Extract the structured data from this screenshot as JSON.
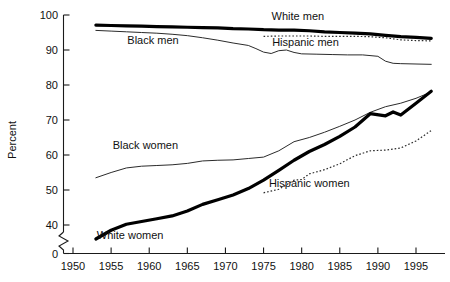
{
  "chart_data": {
    "type": "line",
    "title": "",
    "xlabel": "",
    "ylabel": "Percent",
    "xlim": [
      1950,
      1998
    ],
    "ylim": [
      0,
      100
    ],
    "y_axis_break": {
      "from": 0,
      "to": 38,
      "style": "zigzag"
    },
    "xticks": [
      1950,
      1955,
      1960,
      1965,
      1970,
      1975,
      1980,
      1985,
      1990,
      1995
    ],
    "yticks": [
      0,
      40,
      50,
      60,
      70,
      80,
      90,
      100
    ],
    "grid": false,
    "legend_position": "inline-annotations",
    "series": [
      {
        "name": "White men",
        "style": "thick-solid",
        "label": "White men",
        "label_x": 1979.5,
        "label_y": 99.7,
        "x": [
          1953,
          1955,
          1957,
          1959,
          1961,
          1963,
          1965,
          1967,
          1969,
          1971,
          1973,
          1975,
          1977,
          1979,
          1981,
          1983,
          1985,
          1987,
          1989,
          1991,
          1993,
          1995,
          1997
        ],
        "y": [
          97.1,
          97.0,
          96.9,
          96.8,
          96.7,
          96.6,
          96.5,
          96.4,
          96.3,
          96.1,
          96.0,
          95.8,
          95.7,
          95.7,
          95.5,
          95.2,
          95.0,
          94.8,
          94.6,
          94.2,
          93.8,
          93.6,
          93.3
        ]
      },
      {
        "name": "Black men",
        "style": "thin-solid",
        "label": "Black men",
        "label_x": 1960.5,
        "label_y": 93.0,
        "x": [
          1953,
          1955,
          1957,
          1959,
          1961,
          1963,
          1965,
          1967,
          1969,
          1971,
          1973,
          1974,
          1975,
          1976,
          1977,
          1978,
          1979,
          1980,
          1982,
          1984,
          1986,
          1988,
          1990,
          1991,
          1992,
          1993,
          1995,
          1997
        ],
        "y": [
          95.6,
          95.4,
          95.2,
          95.0,
          94.8,
          94.5,
          94.1,
          93.5,
          92.8,
          92.0,
          91.3,
          90.4,
          89.4,
          89.0,
          89.8,
          90.0,
          89.3,
          88.9,
          88.8,
          88.7,
          88.6,
          88.6,
          88.2,
          86.8,
          86.2,
          86.1,
          86.0,
          85.9
        ]
      },
      {
        "name": "Hispanic men",
        "style": "dotted",
        "label": "Hispanic men",
        "label_x": 1980.5,
        "label_y": 92.2,
        "x": [
          1975,
          1977,
          1979,
          1981,
          1983,
          1985,
          1987,
          1989,
          1991,
          1993,
          1995,
          1997
        ],
        "y": [
          93.9,
          94.0,
          94.0,
          94.0,
          93.9,
          93.9,
          93.9,
          93.8,
          93.5,
          92.9,
          92.7,
          92.6
        ]
      },
      {
        "name": "Black women",
        "style": "thin-solid",
        "label": "Black women",
        "label_x": 1959.5,
        "label_y": 62.8,
        "x": [
          1953,
          1955,
          1957,
          1959,
          1961,
          1963,
          1965,
          1967,
          1969,
          1971,
          1973,
          1975,
          1977,
          1979,
          1981,
          1983,
          1985,
          1987,
          1989,
          1991,
          1993,
          1995,
          1997
        ],
        "y": [
          53.5,
          55.0,
          56.3,
          56.8,
          57.0,
          57.2,
          57.6,
          58.3,
          58.5,
          58.6,
          59.0,
          59.4,
          61.2,
          63.8,
          65.0,
          66.5,
          68.2,
          70.0,
          72.2,
          73.8,
          74.8,
          76.2,
          78.0
        ]
      },
      {
        "name": "White women",
        "style": "thick-solid",
        "label": "White women",
        "label_x": 1957.5,
        "label_y": 37.2,
        "x": [
          1953,
          1955,
          1957,
          1959,
          1961,
          1963,
          1965,
          1967,
          1969,
          1971,
          1973,
          1975,
          1977,
          1979,
          1981,
          1983,
          1985,
          1987,
          1989,
          1991,
          1992,
          1993,
          1995,
          1997
        ],
        "y": [
          36.0,
          38.5,
          40.2,
          41.0,
          41.8,
          42.6,
          44.0,
          45.9,
          47.2,
          48.6,
          50.4,
          52.8,
          55.6,
          58.5,
          61.0,
          63.0,
          65.3,
          68.0,
          71.8,
          71.2,
          72.3,
          71.4,
          74.8,
          78.2
        ]
      },
      {
        "name": "Hispanic women",
        "style": "dotted",
        "label": "Hispanic women",
        "label_x": 1981.0,
        "label_y": 52.0,
        "x": [
          1975,
          1977,
          1979,
          1980,
          1981,
          1983,
          1985,
          1987,
          1989,
          1991,
          1993,
          1995,
          1997
        ],
        "y": [
          49.2,
          50.2,
          52.8,
          53.0,
          54.6,
          55.8,
          57.5,
          59.8,
          61.2,
          61.4,
          62.0,
          64.0,
          67.0
        ]
      }
    ]
  },
  "axes": {
    "ylabel": "Percent",
    "ytick_labels": [
      "0",
      "40",
      "50",
      "60",
      "70",
      "80",
      "90",
      "100"
    ],
    "xtick_labels": [
      "1950",
      "1955",
      "1960",
      "1965",
      "1970",
      "1975",
      "1980",
      "1985",
      "1990",
      "1995"
    ]
  }
}
